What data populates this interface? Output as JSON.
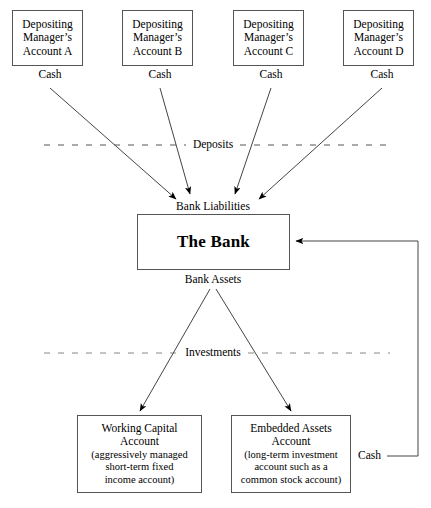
{
  "diagram": {
    "accent_color": "#000000",
    "box_border_color": "#555555",
    "background_color": "#ffffff",
    "accounts": [
      {
        "id": "a",
        "line1": "Depositing",
        "line2": "Manager’s",
        "line3": "Account A",
        "cash_label": "Cash"
      },
      {
        "id": "b",
        "line1": "Depositing",
        "line2": "Manager’s",
        "line3": "Account B",
        "cash_label": "Cash"
      },
      {
        "id": "c",
        "line1": "Depositing",
        "line2": "Manager’s",
        "line3": "Account C",
        "cash_label": "Cash"
      },
      {
        "id": "d",
        "line1": "Depositing",
        "line2": "Manager’s",
        "line3": "Account D",
        "cash_label": "Cash"
      }
    ],
    "divider_deposits": "Deposits",
    "divider_investments": "Investments",
    "bank_liabilities_label": "Bank Liabilities",
    "bank_name": "The Bank",
    "bank_assets_label": "Bank Assets",
    "working_capital": {
      "title_line1": "Working Capital",
      "title_line2": "Account",
      "sub_line1": "(aggressively managed",
      "sub_line2": "short-term fixed",
      "sub_line3": "income account)"
    },
    "embedded_assets": {
      "title_line1": "Embedded Assets",
      "title_line2": "Account",
      "sub_line1": "(long-term investment",
      "sub_line2": "account such as a",
      "sub_line3": "common stock account)"
    },
    "return_cash_label": "Cash"
  }
}
